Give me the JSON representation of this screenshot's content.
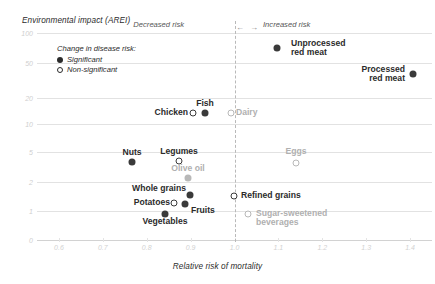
{
  "chart_data": {
    "type": "scatter",
    "title": "",
    "xlabel": "Relative risk of mortality",
    "ylabel": "Environmental impact (AREI)",
    "xlim": [
      0.55,
      1.45
    ],
    "ylim": [
      0,
      100
    ],
    "yscale": "log-like-custom",
    "grid": true,
    "xticks": [
      "0.6",
      "0.7",
      "0.8",
      "0.9",
      "1.0",
      "1.1",
      "1.2",
      "1.3",
      "1.4"
    ],
    "xtick_values": [
      0.6,
      0.7,
      0.8,
      0.9,
      1.0,
      1.1,
      1.2,
      1.3,
      1.4
    ],
    "yticks": [
      "100",
      "50",
      "20",
      "10",
      "5",
      "2",
      "1",
      "0"
    ],
    "ytick_values": [
      100,
      50,
      20,
      10,
      5,
      2,
      1,
      0
    ],
    "reference_line_x": 1.0,
    "annotations": {
      "decreased_risk": "Decreased risk",
      "increased_risk": "Increased risk",
      "left_arrow": "←",
      "right_arrow": "→"
    },
    "legend": {
      "title": "Change in disease risk:",
      "position": "upper-left-inside",
      "entries": [
        {
          "label": "Significant",
          "marker": "filled"
        },
        {
          "label": "Non-significant",
          "marker": "open"
        }
      ]
    },
    "points": [
      {
        "name": "Unprocessed red meat",
        "label": "Unprocessed\nred meat",
        "x": 1.24,
        "y": 62,
        "marker": "filled",
        "color": "dark",
        "px": 277,
        "py": 48,
        "label_px": 291,
        "label_py": 39,
        "anchor": "start"
      },
      {
        "name": "Processed red meat",
        "label": "Processed\nred meat",
        "x": 1.4,
        "y": 37,
        "marker": "filled",
        "color": "dark",
        "px": 413,
        "py": 74,
        "label_px": 405,
        "label_py": 65,
        "anchor": "end"
      },
      {
        "name": "Chicken",
        "label": "Chicken",
        "x": 0.925,
        "y": 15.5,
        "marker": "open",
        "color": "dark",
        "px": 193,
        "py": 113,
        "label_px": 188,
        "label_py": 108,
        "anchor": "end"
      },
      {
        "name": "Fish",
        "label": "Fish",
        "x": 0.955,
        "y": 15.5,
        "marker": "filled",
        "color": "dark",
        "px": 205,
        "py": 113,
        "label_px": 205,
        "label_py": 99,
        "anchor": "middle"
      },
      {
        "name": "Dairy",
        "label": "Dairy",
        "x": 1.02,
        "y": 15.5,
        "marker": "open",
        "color": "grey",
        "px": 231,
        "py": 113,
        "label_px": 236,
        "label_py": 108,
        "anchor": "start"
      },
      {
        "name": "Nuts",
        "label": "Nuts",
        "x": 0.815,
        "y": 4.3,
        "marker": "filled",
        "color": "dark",
        "px": 132,
        "py": 162,
        "label_px": 132,
        "label_py": 148,
        "anchor": "middle"
      },
      {
        "name": "Legumes",
        "label": "Legumes",
        "x": 0.885,
        "y": 4.3,
        "marker": "open",
        "color": "dark",
        "px": 179,
        "py": 161,
        "label_px": 179,
        "label_py": 147,
        "anchor": "middle"
      },
      {
        "name": "Olive oil",
        "label": "Olive oil",
        "x": 0.905,
        "y": 2.4,
        "marker": "filled",
        "color": "grey",
        "px": 188,
        "py": 178,
        "label_px": 188,
        "label_py": 164,
        "anchor": "middle"
      },
      {
        "name": "Whole grains",
        "label": "Whole grains",
        "x": 0.905,
        "y": 1.85,
        "marker": "filled",
        "color": "dark",
        "px": 190,
        "py": 195,
        "label_px": 186,
        "label_py": 184,
        "anchor": "end"
      },
      {
        "name": "Potatoes",
        "label": "Potatoes",
        "x": 0.878,
        "y": 1.6,
        "marker": "open",
        "color": "dark",
        "px": 174,
        "py": 203,
        "label_px": 170,
        "label_py": 198,
        "anchor": "end"
      },
      {
        "name": "Fruits",
        "label": "Fruits",
        "x": 0.895,
        "y": 1.55,
        "marker": "filled",
        "color": "dark",
        "px": 185,
        "py": 204,
        "label_px": 191,
        "label_py": 206,
        "anchor": "start"
      },
      {
        "name": "Vegetables",
        "label": "Vegetables",
        "x": 0.862,
        "y": 1.05,
        "marker": "filled",
        "color": "dark",
        "px": 165,
        "py": 214,
        "label_px": 165,
        "label_py": 217,
        "anchor": "middle"
      },
      {
        "name": "Eggs",
        "label": "Eggs",
        "x": 1.115,
        "y": 4.0,
        "marker": "open",
        "color": "grey",
        "px": 296,
        "py": 163,
        "label_px": 296,
        "label_py": 147,
        "anchor": "middle"
      },
      {
        "name": "Refined grains",
        "label": "Refined grains",
        "x": 1.035,
        "y": 1.85,
        "marker": "open",
        "color": "dark",
        "px": 234,
        "py": 196,
        "label_px": 241,
        "label_py": 191,
        "anchor": "start"
      },
      {
        "name": "Sugar-sweetened beverages",
        "label": "Sugar-sweetened\nbeverages",
        "x": 1.05,
        "y": 1.05,
        "marker": "open",
        "color": "grey",
        "px": 248,
        "py": 214,
        "label_px": 256,
        "label_py": 209,
        "anchor": "start"
      }
    ]
  }
}
